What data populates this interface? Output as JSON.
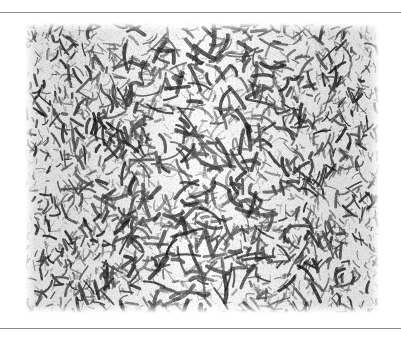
{
  "figure": {
    "kind": "network-render",
    "caption": "",
    "label": "",
    "colors": {
      "page_background": "#ffffff",
      "rule": "#8c8c8c",
      "fiber_dark": "#1c1c1c",
      "fiber_mid": "#6e6e6e",
      "fiber_light": "#b9b9b9",
      "void": "#fbfbfb"
    },
    "rules": [
      {
        "name": "top-rule",
        "y": 12
      },
      {
        "name": "bottom-rule",
        "y": 328
      }
    ],
    "image_box": {
      "x": 25,
      "y": 23,
      "width": 354,
      "height": 290
    }
  },
  "chart_data": {
    "type": "heatmap",
    "title": "",
    "xlabel": "",
    "ylabel": "",
    "grid": false,
    "legend": "none",
    "value_scale": {
      "min": 0,
      "max": 1,
      "units": "normalized optical density"
    },
    "render_params": {
      "strand_count": 2600,
      "strand_length_px": [
        6,
        26
      ],
      "strand_width_px": [
        1.2,
        3.4
      ],
      "seed": 20250611
    },
    "density_profile_x": {
      "x": [
        0.0,
        0.08,
        0.16,
        0.25,
        0.34,
        0.42,
        0.5,
        0.58,
        0.66,
        0.75,
        0.84,
        0.92,
        1.0
      ],
      "values": [
        0.88,
        0.93,
        0.9,
        0.78,
        0.66,
        0.6,
        0.57,
        0.6,
        0.67,
        0.8,
        0.9,
        0.94,
        0.89
      ]
    },
    "density_profile_y": {
      "y": [
        0.0,
        0.12,
        0.25,
        0.37,
        0.5,
        0.62,
        0.75,
        0.87,
        1.0
      ],
      "values": [
        0.74,
        0.82,
        0.85,
        0.8,
        0.78,
        0.83,
        0.86,
        0.84,
        0.72
      ]
    }
  }
}
